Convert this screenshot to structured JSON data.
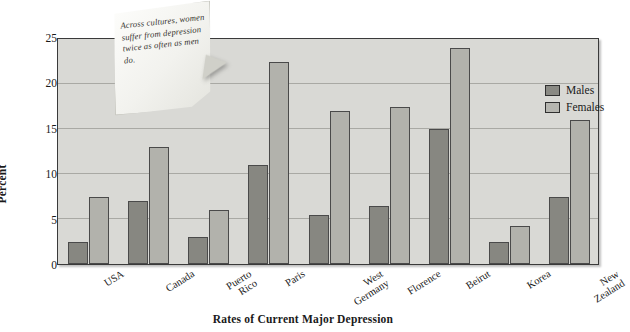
{
  "chart_data": {
    "type": "bar",
    "title": "Rates of Current Major Depression",
    "xlabel": "",
    "ylabel": "Percent",
    "ylim": [
      0,
      25
    ],
    "yticks": [
      0,
      5,
      10,
      15,
      20,
      25
    ],
    "grid": true,
    "legend_position": "top-right",
    "categories": [
      "USA",
      "Canada",
      "Puerto\nRico",
      "Paris",
      "West\nGermany",
      "Florence",
      "Beirut",
      "Korea",
      "New\nZealand"
    ],
    "series": [
      {
        "name": "Males",
        "color": "#878781",
        "values": [
          2.5,
          7.0,
          3.0,
          11.0,
          5.5,
          6.5,
          15.0,
          2.5,
          7.5
        ]
      },
      {
        "name": "Females",
        "color": "#b2b2ac",
        "values": [
          7.5,
          13.0,
          6.0,
          22.5,
          17.0,
          17.5,
          24.0,
          4.2,
          16.0
        ]
      }
    ],
    "annotations": [
      {
        "name": "callout-note",
        "text": "Across cultures, women suffer from depression twice as often as men do."
      }
    ]
  },
  "legend": {
    "items": [
      {
        "label": "Males"
      },
      {
        "label": "Females"
      }
    ]
  },
  "colors": {
    "plot_background": "#d9d9d5",
    "males_bar": "#878781",
    "females_bar": "#b2b2ac",
    "gridline": "#a9a9a4",
    "axis": "#3a3a3a"
  }
}
